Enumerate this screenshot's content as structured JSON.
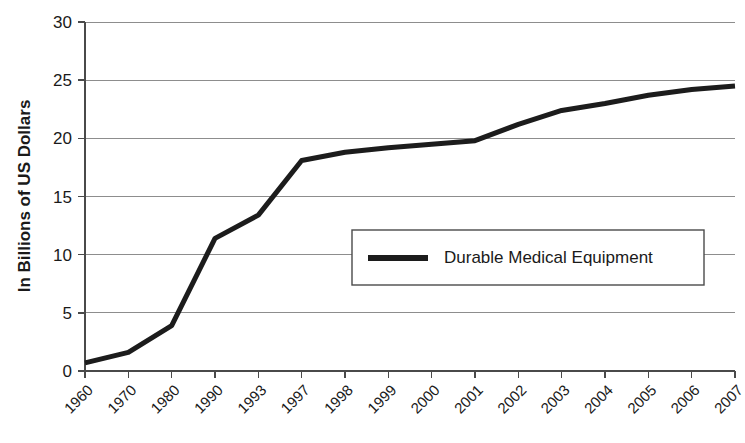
{
  "chart_data": {
    "type": "line",
    "title": "",
    "subtitle": "",
    "xlabel": "",
    "ylabel": "In Billions of US Dollars",
    "categories": [
      "1960",
      "1970",
      "1980",
      "1990",
      "1993",
      "1997",
      "1998",
      "1999",
      "2000",
      "2001",
      "2002",
      "2003",
      "2004",
      "2005",
      "2006",
      "2007"
    ],
    "series": [
      {
        "name": "Durable Medical Equipment",
        "color": "#1c1c1c",
        "values": [
          0.7,
          1.6,
          3.9,
          11.4,
          13.4,
          18.1,
          18.8,
          19.2,
          19.5,
          19.8,
          21.2,
          22.4,
          23.0,
          23.7,
          24.2,
          24.5
        ]
      }
    ],
    "ylim": [
      0,
      30
    ],
    "yticks": [
      0,
      5,
      10,
      15,
      20,
      25,
      30
    ],
    "ytick_labels": [
      "0",
      "5",
      "10",
      "15",
      "20",
      "25",
      "30"
    ],
    "grid": true,
    "grid_axis": "y",
    "legend_position": "center-right",
    "legend_entries": [
      "Durable Medical Equipment"
    ]
  },
  "legend": {
    "label": "Durable Medical Equipment"
  },
  "axes": {
    "y_title": "In Billions of US Dollars"
  }
}
